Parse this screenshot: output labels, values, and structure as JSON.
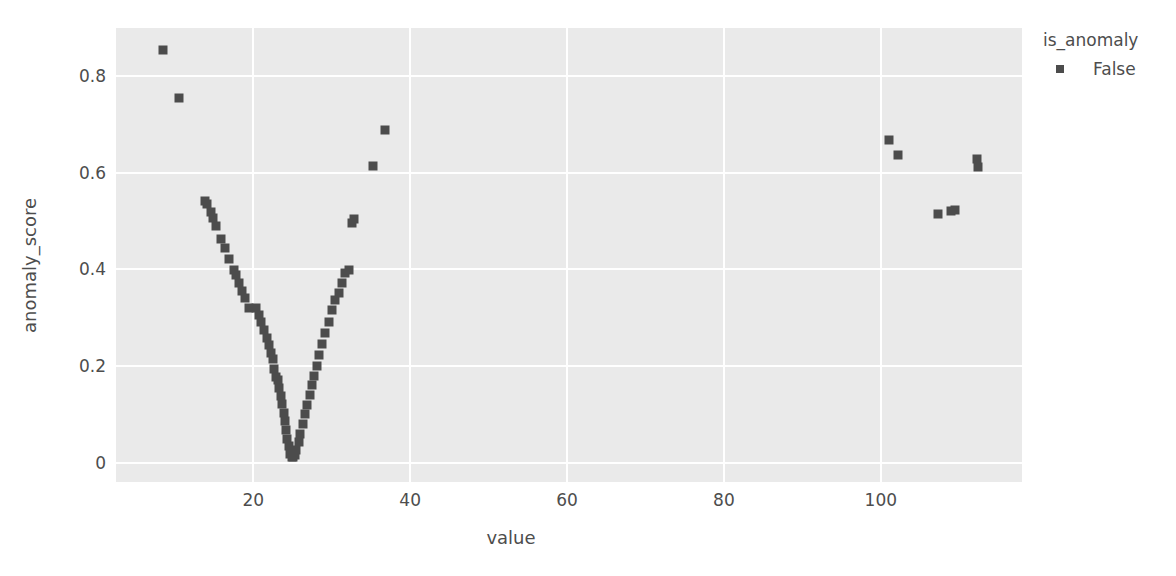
{
  "chart_data": {
    "type": "scatter",
    "title": "",
    "xlabel": "value",
    "ylabel": "anomaly_score",
    "xlim": [
      2.5,
      118
    ],
    "ylim": [
      -0.04,
      0.9
    ],
    "xticks": [
      20,
      40,
      60,
      80,
      100
    ],
    "yticks": [
      0,
      0.2,
      0.4,
      0.6,
      0.8
    ],
    "ytick_labels": [
      "0",
      "0.2",
      "0.4",
      "0.6",
      "0.8"
    ],
    "xtick_labels": [
      "20",
      "40",
      "60",
      "80",
      "100"
    ],
    "grid": true,
    "marker": "square",
    "marker_color": "#4c4c4c",
    "plot_background": "#eaeaea",
    "gridline_color": "#ffffff",
    "legend": {
      "title": "is_anomaly",
      "position": "right",
      "entries": [
        {
          "label": "False",
          "color": "#4c4c4c"
        }
      ]
    },
    "series": [
      {
        "name": "False",
        "color": "#4c4c4c",
        "points": [
          [
            8.5,
            0.855
          ],
          [
            10.5,
            0.755
          ],
          [
            13.8,
            0.542
          ],
          [
            14.1,
            0.536
          ],
          [
            14.6,
            0.518
          ],
          [
            14.9,
            0.506
          ],
          [
            15.3,
            0.49
          ],
          [
            15.9,
            0.464
          ],
          [
            16.4,
            0.444
          ],
          [
            16.9,
            0.421
          ],
          [
            17.5,
            0.399
          ],
          [
            17.8,
            0.389
          ],
          [
            18.2,
            0.372
          ],
          [
            18.6,
            0.356
          ],
          [
            19.0,
            0.34
          ],
          [
            19.4,
            0.321
          ],
          [
            20.4,
            0.32
          ],
          [
            20.7,
            0.305
          ],
          [
            21.0,
            0.291
          ],
          [
            21.4,
            0.274
          ],
          [
            21.7,
            0.258
          ],
          [
            22.0,
            0.243
          ],
          [
            22.3,
            0.228
          ],
          [
            22.5,
            0.215
          ],
          [
            22.7,
            0.195
          ],
          [
            22.9,
            0.178
          ],
          [
            23.1,
            0.172
          ],
          [
            23.3,
            0.155
          ],
          [
            23.5,
            0.139
          ],
          [
            23.7,
            0.122
          ],
          [
            23.9,
            0.103
          ],
          [
            24.0,
            0.086
          ],
          [
            24.2,
            0.068
          ],
          [
            24.3,
            0.05
          ],
          [
            24.5,
            0.034
          ],
          [
            24.7,
            0.018
          ],
          [
            24.9,
            0.012
          ],
          [
            25.1,
            0.011
          ],
          [
            25.3,
            0.015
          ],
          [
            25.5,
            0.026
          ],
          [
            25.8,
            0.042
          ],
          [
            26.0,
            0.06
          ],
          [
            26.3,
            0.08
          ],
          [
            26.6,
            0.1
          ],
          [
            26.9,
            0.12
          ],
          [
            27.2,
            0.14
          ],
          [
            27.5,
            0.16
          ],
          [
            27.8,
            0.18
          ],
          [
            28.1,
            0.2
          ],
          [
            28.4,
            0.222
          ],
          [
            28.8,
            0.245
          ],
          [
            29.2,
            0.268
          ],
          [
            29.6,
            0.292
          ],
          [
            30.0,
            0.316
          ],
          [
            30.4,
            0.336
          ],
          [
            30.9,
            0.352
          ],
          [
            31.3,
            0.372
          ],
          [
            31.7,
            0.392
          ],
          [
            32.2,
            0.398
          ],
          [
            32.6,
            0.497
          ],
          [
            32.8,
            0.504
          ],
          [
            35.3,
            0.614
          ],
          [
            36.8,
            0.688
          ],
          [
            101.0,
            0.669
          ],
          [
            102.2,
            0.638
          ],
          [
            107.3,
            0.515
          ],
          [
            108.9,
            0.521
          ],
          [
            109.4,
            0.524
          ],
          [
            112.2,
            0.629
          ],
          [
            112.4,
            0.613
          ]
        ]
      }
    ]
  }
}
